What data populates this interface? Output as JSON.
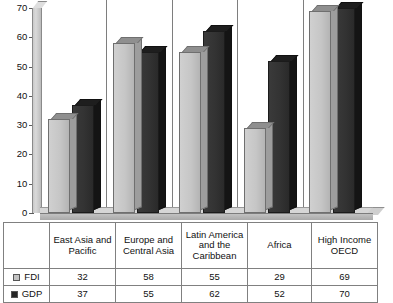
{
  "chart_data": {
    "type": "bar",
    "title": "",
    "subtitle": "",
    "xlabel": "",
    "ylabel": "",
    "ylim": [
      0,
      70
    ],
    "ytick_labels": [
      "0",
      "10",
      "20",
      "30",
      "40",
      "50",
      "60",
      "70"
    ],
    "ytick_values": [
      0,
      10,
      20,
      30,
      40,
      50,
      60,
      70
    ],
    "grid": false,
    "legend_position": "table-left",
    "style": "3d-column",
    "categories": [
      "East Asia and Pacific",
      "Europe and Central Asia",
      "Latin America and the Caribbean",
      "Africa",
      "High Income OECD"
    ],
    "series": [
      {
        "name": "FDI",
        "color": "#c3c3c3",
        "values": [
          32,
          58,
          55,
          29,
          69
        ]
      },
      {
        "name": "GDP",
        "color": "#262626",
        "values": [
          37,
          55,
          62,
          52,
          70
        ]
      }
    ]
  },
  "table": {
    "corner_label": "",
    "category_headers": [
      "East Asia and Pacific",
      "Europe and Central Asia",
      "Latin America and the Caribbean",
      "Africa",
      "High Income OECD"
    ],
    "rows": [
      {
        "label": "FDI",
        "swatch": "light-gray-square-icon",
        "values": [
          "32",
          "58",
          "55",
          "29",
          "69"
        ]
      },
      {
        "label": "GDP",
        "swatch": "dark-square-icon",
        "values": [
          "37",
          "55",
          "62",
          "52",
          "70"
        ]
      }
    ]
  },
  "colors": {
    "fdi_fill": "#c3c3c3",
    "gdp_fill": "#262626",
    "axis": "#5d5d5d",
    "table_border": "#808080",
    "background": "#ffffff"
  }
}
